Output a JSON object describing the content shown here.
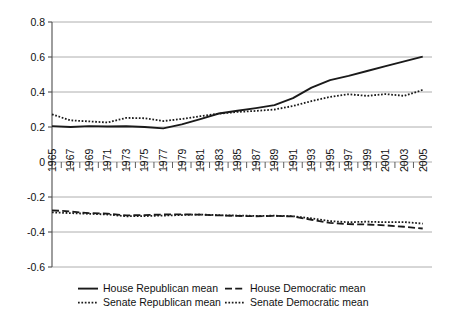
{
  "chart_data": {
    "type": "line",
    "title": "",
    "xlabel": "",
    "ylabel": "",
    "xlim": [
      1965,
      2006
    ],
    "ylim": [
      -0.6,
      0.8
    ],
    "grid": true,
    "grid_axis": "y",
    "legend_position": "bottom",
    "yticks": [
      0.8,
      0.6,
      0.4,
      0.2,
      0,
      -0.2,
      -0.4,
      -0.6
    ],
    "ytick_labels": [
      "0.8",
      "0.6",
      "0.4",
      "0.2",
      "0",
      "-0.2",
      "-0.4",
      "-0.6"
    ],
    "xticks": [
      1965,
      1966,
      1967,
      1968,
      1969,
      1970,
      1971,
      1972,
      1973,
      1974,
      1975,
      1976,
      1977,
      1978,
      1979,
      1980,
      1981,
      1982,
      1983,
      1984,
      1985,
      1986,
      1987,
      1988,
      1989,
      1990,
      1991,
      1992,
      1993,
      1994,
      1995,
      1996,
      1997,
      1998,
      1999,
      2000,
      2001,
      2002,
      2003,
      2004,
      2005
    ],
    "xtick_labels": [
      "1965",
      "1967",
      "1969",
      "1971",
      "1973",
      "1975",
      "1977",
      "1979",
      "1981",
      "1983",
      "1985",
      "1987",
      "1989",
      "1991",
      "1993",
      "1995",
      "1997",
      "1999",
      "2001",
      "2003",
      "2005"
    ],
    "xtick_label_years": [
      1965,
      1967,
      1969,
      1971,
      1973,
      1975,
      1977,
      1979,
      1981,
      1983,
      1985,
      1987,
      1989,
      1991,
      1993,
      1995,
      1997,
      1999,
      2001,
      2003,
      2005
    ],
    "x": [
      1965,
      1967,
      1969,
      1971,
      1973,
      1975,
      1977,
      1979,
      1981,
      1983,
      1985,
      1987,
      1989,
      1991,
      1993,
      1995,
      1997,
      1999,
      2001,
      2003,
      2005
    ],
    "series": [
      {
        "name": "House Republican mean",
        "style": "solid",
        "color": "#1a1a1a",
        "values": [
          0.205,
          0.2,
          0.205,
          0.203,
          0.204,
          0.2,
          0.192,
          0.215,
          0.245,
          0.277,
          0.293,
          0.308,
          0.325,
          0.365,
          0.425,
          0.468,
          0.492,
          0.52,
          0.548,
          0.575,
          0.602
        ]
      },
      {
        "name": "House Democratic mean",
        "style": "dashed",
        "color": "#1a1a1a",
        "values": [
          -0.276,
          -0.283,
          -0.292,
          -0.295,
          -0.305,
          -0.303,
          -0.3,
          -0.299,
          -0.301,
          -0.305,
          -0.308,
          -0.31,
          -0.308,
          -0.311,
          -0.33,
          -0.348,
          -0.355,
          -0.357,
          -0.362,
          -0.37,
          -0.38
        ]
      },
      {
        "name": "Senate Republican mean",
        "style": "dotted",
        "color": "#1a1a1a",
        "values": [
          0.272,
          0.238,
          0.232,
          0.226,
          0.252,
          0.25,
          0.234,
          0.246,
          0.262,
          0.276,
          0.286,
          0.292,
          0.3,
          0.32,
          0.348,
          0.372,
          0.387,
          0.378,
          0.388,
          0.378,
          0.412
        ]
      },
      {
        "name": "Senate Democratic mean",
        "style": "dotted",
        "color": "#1a1a1a",
        "values": [
          -0.288,
          -0.292,
          -0.296,
          -0.3,
          -0.31,
          -0.309,
          -0.306,
          -0.303,
          -0.3,
          -0.304,
          -0.306,
          -0.308,
          -0.307,
          -0.31,
          -0.322,
          -0.338,
          -0.344,
          -0.341,
          -0.344,
          -0.343,
          -0.352
        ]
      }
    ]
  },
  "legend": {
    "entries": [
      {
        "label": "House Republican mean",
        "style": "solid"
      },
      {
        "label": "House Democratic mean",
        "style": "dashed"
      },
      {
        "label": "Senate Republican mean",
        "style": "dotted"
      },
      {
        "label": "Senate Democratic mean",
        "style": "dotted"
      }
    ]
  },
  "colors": {
    "ink": "#1a1a1a",
    "grid": "#9a9a9a",
    "axis": "#4d4d4d",
    "background": "#ffffff"
  }
}
